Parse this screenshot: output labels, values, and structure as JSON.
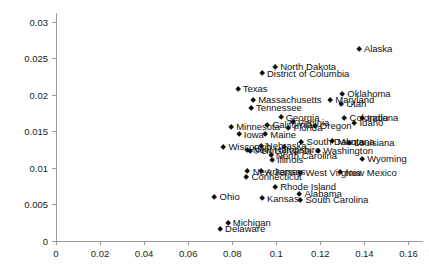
{
  "chart_data": {
    "type": "scatter",
    "title": "",
    "xlabel": "",
    "ylabel": "",
    "xlim": [
      0,
      0.1666
    ],
    "ylim": [
      0,
      0.0312
    ],
    "grid": false,
    "legend": "none",
    "xticks": [
      "0",
      "0.02",
      "0.04",
      "0.06",
      "0.08",
      "0.1",
      "0.12",
      "0.14",
      "0.16"
    ],
    "xtick_values": [
      0,
      0.02,
      0.04,
      0.06,
      0.08,
      0.1,
      0.12,
      0.14,
      0.16
    ],
    "yticks": [
      "0",
      "0.005",
      "0.01",
      "0.015",
      "0.02",
      "0.025",
      "0.03"
    ],
    "ytick_values": [
      0,
      0.005,
      0.01,
      0.015,
      0.02,
      0.025,
      0.03
    ],
    "marker": "diamond",
    "marker_color": "#111111",
    "axis_color": "#9a9a9a",
    "points": [
      {
        "label": "Alaska",
        "x": 0.1375,
        "y": 0.02625
      },
      {
        "label": "North Dakota",
        "x": 0.0995,
        "y": 0.02385
      },
      {
        "label": "District of Columbia",
        "x": 0.0935,
        "y": 0.0229
      },
      {
        "label": "Texas",
        "x": 0.0825,
        "y": 0.0208
      },
      {
        "label": "Oklahoma",
        "x": 0.13,
        "y": 0.0201
      },
      {
        "label": "Massachusetts",
        "x": 0.0895,
        "y": 0.0193
      },
      {
        "label": "Maryland",
        "x": 0.1245,
        "y": 0.0193
      },
      {
        "label": "Utah",
        "x": 0.1295,
        "y": 0.01875
      },
      {
        "label": "Tennessee",
        "x": 0.0885,
        "y": 0.0182
      },
      {
        "label": "Georgia",
        "x": 0.102,
        "y": 0.0169
      },
      {
        "label": "Colorado",
        "x": 0.131,
        "y": 0.0168
      },
      {
        "label": "Indiana",
        "x": 0.139,
        "y": 0.0168
      },
      {
        "label": "Virginia",
        "x": 0.1075,
        "y": 0.0162
      },
      {
        "label": "Idaho",
        "x": 0.1355,
        "y": 0.01615
      },
      {
        "label": "California",
        "x": 0.096,
        "y": 0.01585
      },
      {
        "label": "Oregon",
        "x": 0.1175,
        "y": 0.01575
      },
      {
        "label": "Florida",
        "x": 0.1055,
        "y": 0.01545
      },
      {
        "label": "Minnesota",
        "x": 0.0795,
        "y": 0.0156
      },
      {
        "label": "Iowa",
        "x": 0.083,
        "y": 0.01455
      },
      {
        "label": "Maine",
        "x": 0.095,
        "y": 0.01455
      },
      {
        "label": "South Dakota",
        "x": 0.1115,
        "y": 0.01355
      },
      {
        "label": "Montana",
        "x": 0.1255,
        "y": 0.0136
      },
      {
        "label": "Louisiana",
        "x": 0.133,
        "y": 0.01345
      },
      {
        "label": "Nebraska",
        "x": 0.093,
        "y": 0.013
      },
      {
        "label": "Wisconsin",
        "x": 0.076,
        "y": 0.0129
      },
      {
        "label": "Alaska2",
        "x": 0.1035,
        "y": 0.0129
      },
      {
        "label": "New Hampshire",
        "x": 0.087,
        "y": 0.01245
      },
      {
        "label": "Pennsylvania",
        "x": 0.088,
        "y": 0.01235
      },
      {
        "label": "Washington",
        "x": 0.119,
        "y": 0.01225
      },
      {
        "label": "North Carolina",
        "x": 0.0975,
        "y": 0.0117
      },
      {
        "label": "Illinois",
        "x": 0.098,
        "y": 0.0111
      },
      {
        "label": "Wyoming",
        "x": 0.139,
        "y": 0.0112
      },
      {
        "label": "New Jersey",
        "x": 0.087,
        "y": 0.0095
      },
      {
        "label": "Arkansas",
        "x": 0.093,
        "y": 0.0095
      },
      {
        "label": "West Virginia",
        "x": 0.111,
        "y": 0.0093
      },
      {
        "label": "New Mexico",
        "x": 0.129,
        "y": 0.00935
      },
      {
        "label": "Connecticut",
        "x": 0.0865,
        "y": 0.0088
      },
      {
        "label": "Rhode Island",
        "x": 0.0995,
        "y": 0.0074
      },
      {
        "label": "Alabama",
        "x": 0.1105,
        "y": 0.00645
      },
      {
        "label": "Ohio",
        "x": 0.072,
        "y": 0.006
      },
      {
        "label": "Kansas",
        "x": 0.0935,
        "y": 0.0058
      },
      {
        "label": "South Carolina",
        "x": 0.111,
        "y": 0.00565
      },
      {
        "label": "Michigan",
        "x": 0.078,
        "y": 0.00245
      },
      {
        "label": "Delaware",
        "x": 0.0745,
        "y": 0.00165
      }
    ]
  }
}
